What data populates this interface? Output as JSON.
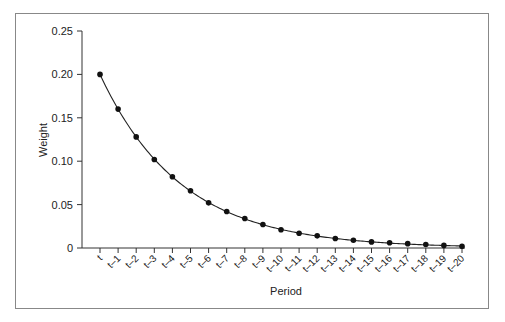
{
  "chart_data": {
    "type": "line",
    "title": "",
    "xlabel": "Period",
    "ylabel": "Weight",
    "ylim": [
      0,
      0.25
    ],
    "yticks": [
      "0",
      "0.05",
      "0.10",
      "0.15",
      "0.20",
      "0.25"
    ],
    "grid": false,
    "legend": "none",
    "categories": [
      "t",
      "t–1",
      "t–2",
      "t–3",
      "t–4",
      "t–5",
      "t–6",
      "t–7",
      "t–8",
      "t–9",
      "t–10",
      "t–11",
      "t–12",
      "t–13",
      "t–14",
      "t–15",
      "t–16",
      "t–17",
      "t–18",
      "t–19",
      "t–20"
    ],
    "series": [
      {
        "name": "Weight",
        "values": [
          0.2,
          0.16,
          0.128,
          0.102,
          0.082,
          0.066,
          0.052,
          0.042,
          0.034,
          0.027,
          0.021,
          0.017,
          0.014,
          0.011,
          0.009,
          0.007,
          0.006,
          0.005,
          0.004,
          0.003,
          0.002
        ]
      }
    ]
  }
}
